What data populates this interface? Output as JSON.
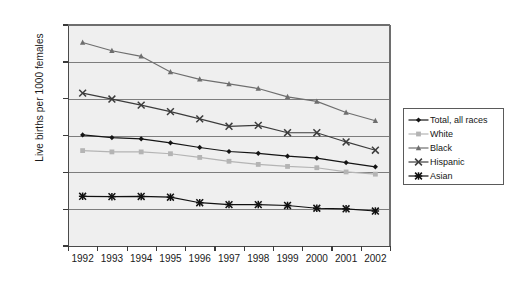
{
  "chart_data": {
    "type": "line",
    "title": "",
    "xlabel": "",
    "ylabel": "Live births per 1000 females",
    "categories": [
      "1992",
      "1993",
      "1994",
      "1995",
      "1996",
      "1997",
      "1998",
      "1999",
      "2000",
      "2001",
      "2002"
    ],
    "x": [
      1992,
      1993,
      1994,
      1995,
      1996,
      1997,
      1998,
      1999,
      2000,
      2001,
      2002
    ],
    "ylim": [
      0,
      120
    ],
    "ytick_labels": [
      "120.0",
      "100.0",
      "80.0",
      "60.0",
      "40.0",
      "20.0",
      "0"
    ],
    "ytick_values": [
      120,
      100,
      80,
      60,
      40,
      20,
      0
    ],
    "grid": true,
    "legend_position": "right",
    "plot_background": "#efefef",
    "series": [
      {
        "name": "Total, all races",
        "marker": "diamond",
        "color": "#141414",
        "values": [
          60.3,
          58.9,
          58.2,
          56.0,
          53.5,
          51.3,
          50.3,
          48.8,
          47.7,
          45.3,
          43.0
        ]
      },
      {
        "name": "White",
        "marker": "square",
        "color": "#b4b4b4",
        "values": [
          51.8,
          51.1,
          51.1,
          50.1,
          48.1,
          46.0,
          44.3,
          43.2,
          42.5,
          40.2,
          39.0
        ]
      },
      {
        "name": "Black",
        "marker": "triangle",
        "color": "#6e6e6e",
        "values": [
          110.5,
          106.0,
          103.0,
          94.5,
          90.5,
          88.0,
          85.5,
          81.0,
          78.5,
          72.5,
          68.0
        ]
      },
      {
        "name": "Hispanic",
        "marker": "cross",
        "color": "#3c3c3c",
        "values": [
          83.0,
          79.8,
          76.5,
          73.0,
          69.0,
          65.0,
          65.5,
          61.5,
          61.5,
          56.5,
          52.0
        ]
      },
      {
        "name": "Asian",
        "marker": "star",
        "color": "#101010",
        "values": [
          27.0,
          26.8,
          26.9,
          26.5,
          23.5,
          22.5,
          22.5,
          22.0,
          20.5,
          20.2,
          19.0
        ]
      }
    ]
  },
  "legend": {
    "items": [
      {
        "label": "Total, all races"
      },
      {
        "label": "White"
      },
      {
        "label": "Black"
      },
      {
        "label": "Hispanic"
      },
      {
        "label": "Asian"
      }
    ]
  }
}
